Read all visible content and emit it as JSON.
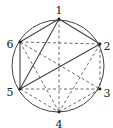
{
  "diagram": {
    "type": "inscribed-hexagon-graph",
    "circle": {
      "cx": 58,
      "cy": 66,
      "r": 46,
      "stroke": "#444444"
    },
    "vertices": [
      {
        "id": "1",
        "label": "1",
        "x": 59,
        "y": 19,
        "lx": 59,
        "ly": 11
      },
      {
        "id": "2",
        "label": "2",
        "x": 100,
        "y": 44,
        "lx": 107,
        "ly": 47
      },
      {
        "id": "3",
        "label": "3",
        "x": 100,
        "y": 89,
        "lx": 107,
        "ly": 94
      },
      {
        "id": "4",
        "label": "4",
        "x": 59,
        "y": 112,
        "lx": 59,
        "ly": 125
      },
      {
        "id": "5",
        "label": "5",
        "x": 20,
        "y": 89,
        "lx": 10,
        "ly": 93
      },
      {
        "id": "6",
        "label": "6",
        "x": 20,
        "y": 42,
        "lx": 10,
        "ly": 45
      }
    ],
    "solid_edges": [
      [
        "1",
        "2"
      ],
      [
        "1",
        "6"
      ],
      [
        "1",
        "5"
      ],
      [
        "5",
        "6"
      ],
      [
        "2",
        "5"
      ]
    ],
    "dashed_edges": [
      [
        "1",
        "4"
      ],
      [
        "6",
        "2"
      ],
      [
        "2",
        "3"
      ],
      [
        "2",
        "4"
      ],
      [
        "3",
        "4"
      ],
      [
        "5",
        "3"
      ],
      [
        "5",
        "4"
      ],
      [
        "6",
        "4"
      ],
      [
        "6",
        "3"
      ]
    ],
    "line_color": "#444444"
  }
}
